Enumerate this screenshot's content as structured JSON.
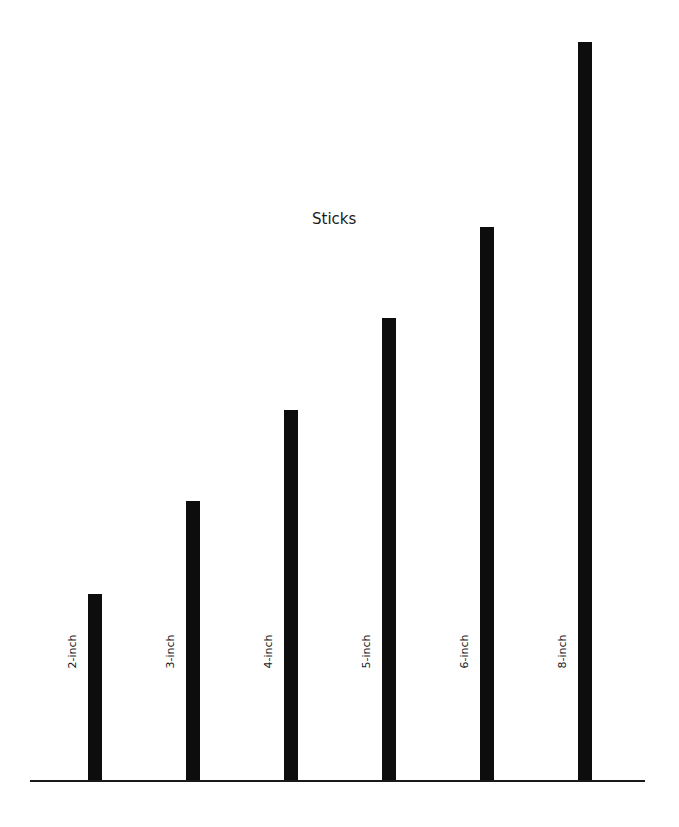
{
  "title": "Sticks",
  "colors": {
    "stick": "#0d0d0d",
    "baseline": "#1a1a1a",
    "background": "#ffffff"
  },
  "baseline_y": 781,
  "sticks": [
    {
      "label": "2-inch",
      "length_in": 2,
      "x": 88,
      "top": 594
    },
    {
      "label": "3-inch",
      "length_in": 3,
      "x": 186,
      "top": 501
    },
    {
      "label": "4-inch",
      "length_in": 4,
      "x": 284,
      "top": 410
    },
    {
      "label": "5-inch",
      "length_in": 5,
      "x": 382,
      "top": 318
    },
    {
      "label": "6-inch",
      "length_in": 6,
      "x": 480,
      "top": 227
    },
    {
      "label": "8-inch",
      "length_in": 8,
      "x": 578,
      "top": 42
    }
  ]
}
